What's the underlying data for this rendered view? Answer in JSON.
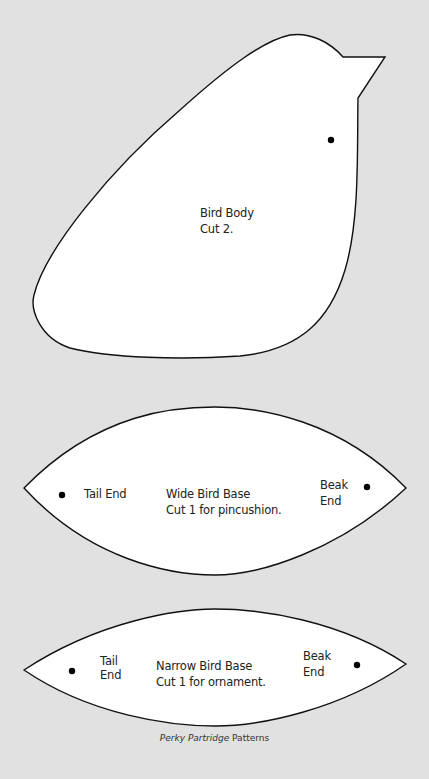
{
  "colors": {
    "background": "#e1e1e1",
    "piece_fill": "#ffffff",
    "outline": "#111111",
    "text": "#222222"
  },
  "pieces": {
    "bird_body": {
      "title": "Bird Body",
      "instruction": "Cut 2."
    },
    "wide_base": {
      "title": "Wide Bird Base",
      "instruction": "Cut 1 for pincushion.",
      "tail_label": "Tail End",
      "beak_label_1": "Beak",
      "beak_label_2": "End"
    },
    "narrow_base": {
      "title": "Narrow Bird Base",
      "instruction": "Cut 1 for ornament.",
      "tail_label_1": "Tail",
      "tail_label_2": "End",
      "beak_label_1": "Beak",
      "beak_label_2": "End"
    }
  },
  "caption": {
    "italic": "Perky Partridge",
    "rest": " Patterns"
  }
}
